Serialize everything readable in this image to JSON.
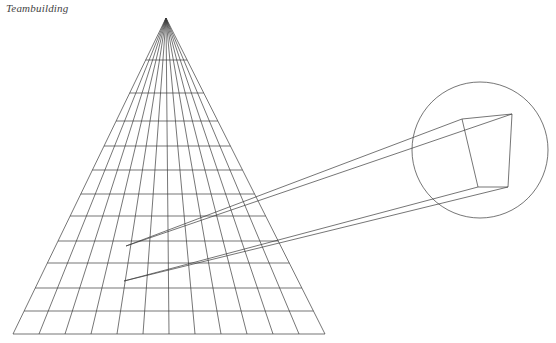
{
  "caption": {
    "text": "Teambuilding"
  },
  "colors": {
    "background": "#ffffff",
    "stroke": "#3b3b3b",
    "stroke_light": "#5a5a5a",
    "caption": "#444444"
  },
  "figure": {
    "title": "Teambuilding",
    "canvas": {
      "width": 556,
      "height": 343
    },
    "stroke_width": 0.7,
    "triangle": {
      "name": "perspective-grid-triangle",
      "apex": {
        "x": 166,
        "y": 18
      },
      "base_left": {
        "x": 13,
        "y": 334
      },
      "base_right": {
        "x": 325,
        "y": 334
      },
      "radial_line_count": 13,
      "radial_base_x": [
        13,
        39,
        65,
        91,
        117,
        143,
        169,
        195,
        221,
        247,
        273,
        299,
        325
      ],
      "horizontal_rows_y": [
        60,
        93,
        121,
        146,
        170,
        194,
        216,
        241,
        263,
        288,
        311,
        334
      ]
    },
    "circle": {
      "name": "projection-circle",
      "cx": 480,
      "cy": 150,
      "r": 68
    },
    "cube": {
      "name": "cube-quad",
      "front_face": [
        {
          "x": 462,
          "y": 119
        },
        {
          "x": 512,
          "y": 114
        },
        {
          "x": 508,
          "y": 187
        },
        {
          "x": 478,
          "y": 187
        }
      ]
    },
    "projection": {
      "name": "projection-rays",
      "vanishing_points": [
        {
          "x": 126,
          "y": 246
        },
        {
          "x": 124,
          "y": 281
        }
      ],
      "rays": [
        {
          "from": {
            "x": 126,
            "y": 246
          },
          "to": {
            "x": 462,
            "y": 119
          }
        },
        {
          "from": {
            "x": 126,
            "y": 246
          },
          "to": {
            "x": 512,
            "y": 114
          }
        },
        {
          "from": {
            "x": 124,
            "y": 281
          },
          "to": {
            "x": 478,
            "y": 187
          }
        },
        {
          "from": {
            "x": 124,
            "y": 281
          },
          "to": {
            "x": 508,
            "y": 187
          }
        }
      ]
    }
  }
}
